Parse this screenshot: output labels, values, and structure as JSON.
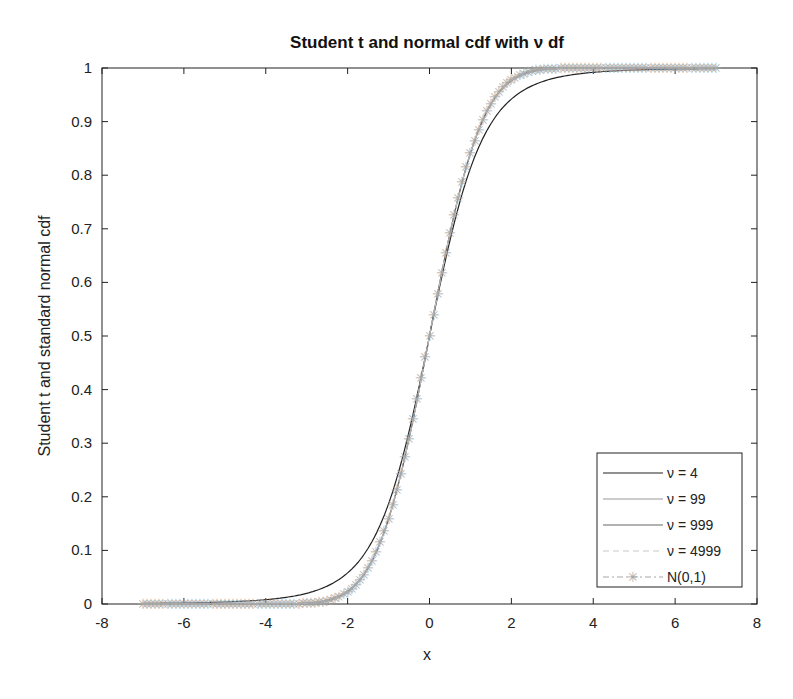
{
  "chart_data": {
    "type": "line",
    "title": "Student t and normal cdf with ν df",
    "xlabel": "x",
    "ylabel": "Student t and standard normal cdf",
    "xlim": [
      -8,
      8
    ],
    "ylim": [
      0,
      1
    ],
    "xticks": [
      -8,
      -6,
      -4,
      -2,
      0,
      2,
      4,
      6,
      8
    ],
    "yticks": [
      0,
      0.1,
      0.2,
      0.3,
      0.4,
      0.5,
      0.6,
      0.7,
      0.8,
      0.9,
      1
    ],
    "grid": false,
    "legend_position": "lower right",
    "x_range_plotted": [
      -7,
      7
    ],
    "series": [
      {
        "name": "ν = 4",
        "dist": "t",
        "df": 4,
        "color": "#222222",
        "style": "solid"
      },
      {
        "name": "ν = 99",
        "dist": "t",
        "df": 99,
        "color": "#9a9a9a",
        "style": "solid"
      },
      {
        "name": "ν = 999",
        "dist": "t",
        "df": 999,
        "color": "#666666",
        "style": "solid"
      },
      {
        "name": "ν = 4999",
        "dist": "t",
        "df": 4999,
        "color": "#c8c8c8",
        "style": "dashed"
      },
      {
        "name": "N(0,1)",
        "dist": "normal",
        "color": "#a8a8a8",
        "style": "dashdot",
        "marker": "*"
      }
    ],
    "sample_values": {
      "x": [
        -7,
        -4,
        -2,
        -1,
        0,
        1,
        2,
        4,
        7
      ],
      "t4": [
        0.001,
        0.008,
        0.058,
        0.187,
        0.5,
        0.813,
        0.942,
        0.992,
        0.999
      ],
      "normal": [
        0.0,
        3e-05,
        0.023,
        0.159,
        0.5,
        0.841,
        0.977,
        0.99997,
        1.0
      ]
    }
  }
}
